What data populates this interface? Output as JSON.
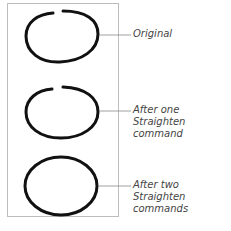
{
  "figure": {
    "labels": [
      {
        "line1": "Original",
        "line2": ""
      },
      {
        "line1": "After one Straighten",
        "line2": "command"
      },
      {
        "line1": "After two Straighten",
        "line2": "commands"
      }
    ],
    "caption": "Figure ... (cut off)",
    "colors": {
      "stroke": "#111111",
      "frame": "#bdbdbd",
      "leader": "#888888",
      "text": "#444444"
    }
  }
}
